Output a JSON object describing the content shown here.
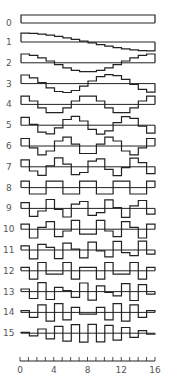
{
  "chart_data": {
    "type": "line",
    "title": "",
    "row_labels": [
      "0",
      "1",
      "2",
      "3",
      "4",
      "5",
      "6",
      "7",
      "8",
      "9",
      "10",
      "11",
      "12",
      "13",
      "14",
      "15"
    ],
    "x_ticks": [
      "0",
      "4",
      "8",
      "12",
      "16"
    ],
    "x_range": [
      0,
      16
    ],
    "series": [
      {
        "name": "0",
        "values": [
          1,
          1,
          1,
          1,
          1,
          1,
          1,
          1,
          1,
          1,
          1,
          1,
          1,
          1,
          1,
          1
        ]
      },
      {
        "name": "1",
        "values": [
          0.99,
          0.96,
          0.88,
          0.77,
          0.63,
          0.47,
          0.29,
          0.1,
          -0.1,
          -0.29,
          -0.47,
          -0.63,
          -0.77,
          -0.88,
          -0.96,
          -0.99
        ]
      },
      {
        "name": "2",
        "values": [
          0.98,
          0.83,
          0.56,
          0.2,
          -0.2,
          -0.56,
          -0.83,
          -0.98,
          -0.98,
          -0.83,
          -0.56,
          -0.2,
          0.2,
          0.56,
          0.83,
          0.98
        ]
      },
      {
        "name": "3",
        "values": [
          0.96,
          0.63,
          0.1,
          -0.47,
          -0.88,
          -0.99,
          -0.77,
          -0.29,
          0.29,
          0.77,
          0.99,
          0.88,
          0.47,
          -0.1,
          -0.63,
          -0.96
        ]
      },
      {
        "name": "4",
        "values": [
          0.92,
          0.38,
          -0.38,
          -0.92,
          -0.92,
          -0.38,
          0.38,
          0.92,
          0.92,
          0.38,
          -0.38,
          -0.92,
          -0.92,
          -0.38,
          0.38,
          0.92
        ]
      },
      {
        "name": "5",
        "values": [
          0.88,
          0.1,
          -0.77,
          -0.96,
          -0.29,
          0.63,
          0.99,
          0.47,
          -0.47,
          -0.99,
          -0.63,
          0.29,
          0.96,
          0.77,
          -0.1,
          -0.88
        ]
      },
      {
        "name": "6",
        "values": [
          0.83,
          -0.2,
          -0.98,
          -0.56,
          0.56,
          0.98,
          0.2,
          -0.83,
          -0.83,
          0.2,
          0.98,
          0.56,
          -0.56,
          -0.98,
          -0.2,
          0.83
        ]
      },
      {
        "name": "7",
        "values": [
          0.77,
          -0.47,
          -0.96,
          0.1,
          0.99,
          0.29,
          -0.88,
          -0.63,
          0.63,
          0.88,
          -0.29,
          -0.99,
          -0.1,
          0.96,
          0.47,
          -0.77
        ]
      },
      {
        "name": "8",
        "values": [
          0.71,
          -0.71,
          -0.71,
          0.71,
          0.71,
          -0.71,
          -0.71,
          0.71,
          0.71,
          -0.71,
          -0.71,
          0.71,
          0.71,
          -0.71,
          -0.71,
          0.71
        ]
      },
      {
        "name": "9",
        "values": [
          0.63,
          -0.88,
          -0.29,
          0.99,
          -0.1,
          -0.96,
          0.47,
          0.77,
          -0.77,
          -0.47,
          0.96,
          0.1,
          -0.99,
          0.29,
          0.88,
          -0.63
        ]
      },
      {
        "name": "10",
        "values": [
          0.56,
          -0.98,
          0.2,
          0.83,
          -0.83,
          -0.2,
          0.98,
          -0.56,
          -0.56,
          0.98,
          -0.2,
          -0.83,
          0.83,
          0.2,
          -0.98,
          0.56
        ]
      },
      {
        "name": "11",
        "values": [
          0.47,
          -0.99,
          0.63,
          0.29,
          -0.96,
          0.77,
          0.1,
          -0.88,
          0.88,
          -0.1,
          -0.77,
          0.96,
          -0.29,
          -0.63,
          0.99,
          -0.47
        ]
      },
      {
        "name": "12",
        "values": [
          0.38,
          -0.92,
          0.92,
          -0.38,
          -0.38,
          0.92,
          -0.92,
          0.38,
          0.38,
          -0.92,
          0.92,
          -0.38,
          -0.38,
          0.92,
          -0.92,
          0.38
        ]
      },
      {
        "name": "13",
        "values": [
          0.29,
          -0.77,
          0.99,
          -0.88,
          0.47,
          0.1,
          -0.63,
          0.96,
          -0.96,
          0.63,
          -0.1,
          -0.47,
          0.88,
          -0.99,
          0.77,
          -0.29
        ]
      },
      {
        "name": "14",
        "values": [
          0.2,
          -0.56,
          0.83,
          -0.98,
          0.98,
          -0.83,
          0.56,
          -0.2,
          -0.2,
          0.56,
          -0.83,
          0.98,
          -0.98,
          0.83,
          -0.56,
          0.2
        ]
      },
      {
        "name": "15",
        "values": [
          0.1,
          -0.29,
          0.47,
          -0.63,
          0.77,
          -0.88,
          0.96,
          -0.99,
          0.99,
          -0.96,
          0.88,
          -0.77,
          0.63,
          -0.47,
          0.29,
          -0.1
        ]
      }
    ],
    "grid": false,
    "legend": "none"
  },
  "style": {
    "line_color": "#222222",
    "label_color": "#555555"
  }
}
